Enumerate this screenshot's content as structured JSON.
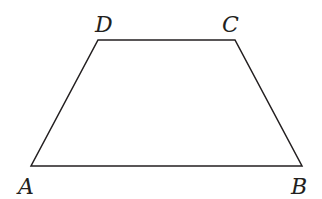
{
  "figure": {
    "type": "trapezoid",
    "stroke_color": "#231f20",
    "vertices": {
      "A": {
        "label": "A",
        "x": 31,
        "y": 166
      },
      "B": {
        "label": "B",
        "x": 302,
        "y": 166
      },
      "C": {
        "label": "C",
        "x": 235,
        "y": 40
      },
      "D": {
        "label": "D",
        "x": 98,
        "y": 40
      }
    }
  }
}
